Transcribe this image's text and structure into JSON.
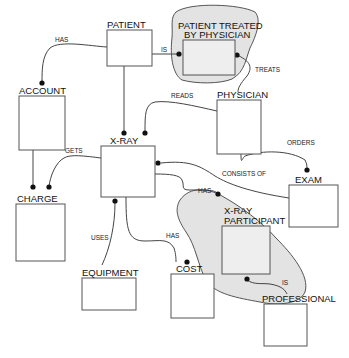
{
  "diagram": {
    "type": "entity-relationship",
    "entities": [
      {
        "id": "patient",
        "label": "PATIENT"
      },
      {
        "id": "patient_treated",
        "label_line1": "PATIENT TREATED",
        "label_line2": "BY PHYSICIAN"
      },
      {
        "id": "account",
        "label": "ACCOUNT"
      },
      {
        "id": "physician",
        "label": "PHYSICIAN"
      },
      {
        "id": "xray",
        "label": "X-RAY"
      },
      {
        "id": "charge",
        "label": "CHARGE"
      },
      {
        "id": "exam",
        "label": "EXAM"
      },
      {
        "id": "xray_participant",
        "label_line1": "X-RAY",
        "label_line2": "PARTICIPANT"
      },
      {
        "id": "equipment",
        "label": "EQUIPMENT"
      },
      {
        "id": "cost",
        "label": "COST"
      },
      {
        "id": "professional",
        "label": "PROFESSIONAL"
      }
    ],
    "relationships": [
      {
        "from": "patient",
        "to": "account",
        "label": "HAS"
      },
      {
        "from": "patient",
        "to": "patient_treated",
        "label": "IS"
      },
      {
        "from": "physician",
        "to": "patient_treated",
        "label": "TREATS"
      },
      {
        "from": "physician",
        "to": "xray",
        "label": "READS"
      },
      {
        "from": "physician",
        "to": "exam",
        "label": "ORDERS"
      },
      {
        "from": "xray",
        "to": "charge",
        "label": "GETS"
      },
      {
        "from": "exam",
        "to": "xray",
        "label": "CONSISTS OF"
      },
      {
        "from": "xray",
        "to": "xray_participant",
        "label": "HAS"
      },
      {
        "from": "equipment",
        "to": "xray",
        "label": "USES"
      },
      {
        "from": "xray",
        "to": "cost",
        "label": "HAS"
      },
      {
        "from": "professional",
        "to": "xray_participant",
        "label": "IS"
      },
      {
        "from": "account",
        "to": "charge",
        "label": ""
      },
      {
        "from": "patient",
        "to": "xray",
        "label": ""
      }
    ]
  }
}
